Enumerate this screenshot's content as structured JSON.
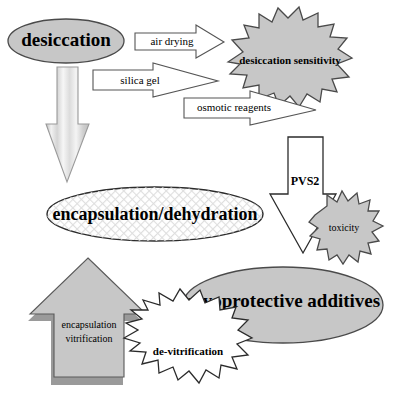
{
  "diagram": {
    "canvas": {
      "width": 394,
      "height": 399,
      "background": "#ffffff"
    },
    "colors": {
      "node_gray": "#c7c7c7",
      "node_gray_dark": "#bdbdbd",
      "outline": "#4a4a4a",
      "outline_dark": "#2b2b2b",
      "white": "#ffffff",
      "shadow": "#9a9a9a",
      "text": "#000000",
      "hatch": "#d8d8d8"
    },
    "nodes": [
      {
        "id": "desiccation",
        "label": "desiccation",
        "shape": "ellipse",
        "fill": "node_gray",
        "emphasis": "bold",
        "font_size": 19
      },
      {
        "id": "desiccation-sensitivity",
        "label": "desiccation sensitivity",
        "shape": "starburst",
        "fill": "node_gray",
        "emphasis": "bold",
        "font_size": 11
      },
      {
        "id": "encapsulation-dehydration",
        "label": "encapsulation/dehydration",
        "shape": "ellipse",
        "fill": "hatch-pattern",
        "emphasis": "bold",
        "font_size": 18
      },
      {
        "id": "toxicity",
        "label": "toxicity",
        "shape": "starburst",
        "fill": "node_gray",
        "emphasis": "normal",
        "font_size": 10
      },
      {
        "id": "cryoprotective-additives",
        "label": "cryoprotective additives",
        "shape": "ellipse",
        "fill": "node_gray",
        "emphasis": "bold",
        "font_size": 19
      },
      {
        "id": "de-vitrification",
        "label": "de-vitrification",
        "shape": "starburst",
        "fill": "white",
        "emphasis": "bold",
        "font_size": 11
      }
    ],
    "arrows": [
      {
        "id": "air-drying",
        "label": "air drying",
        "from": "desiccation",
        "to": "desiccation-sensitivity",
        "direction": "right",
        "fill": "white",
        "font_size": 11
      },
      {
        "id": "silica-gel",
        "label": "silica gel",
        "from": "desiccation",
        "to": "desiccation-sensitivity",
        "direction": "right",
        "fill": "white",
        "font_size": 11
      },
      {
        "id": "osmotic-reagents",
        "label": "osmotic reagents",
        "from": "desiccation",
        "to": "desiccation-sensitivity",
        "direction": "right",
        "fill": "white",
        "font_size": 11
      },
      {
        "id": "desiccation-to-encapsulation",
        "label": "",
        "from": "desiccation",
        "to": "encapsulation-dehydration",
        "direction": "down",
        "fill": "striped",
        "font_size": 0
      },
      {
        "id": "pvs2",
        "label": "PVS2",
        "from": "cryoprotective-additives",
        "to": "toxicity",
        "direction": "down",
        "fill": "white",
        "font_size": 12
      },
      {
        "id": "encapsulation-vitrification",
        "label": "encapsulation vitrification",
        "label_lines": [
          "encapsulation",
          "vitrification"
        ],
        "from": "encapsulation-dehydration",
        "to": "cryoprotective-additives",
        "direction": "up",
        "fill": "node_gray",
        "font_size": 10
      }
    ]
  }
}
